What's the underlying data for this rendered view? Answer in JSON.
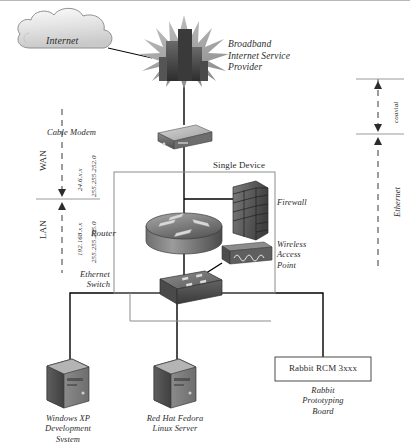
{
  "diagram": {
    "nodes": {
      "internet": {
        "label": "Internet",
        "shape": "cloud"
      },
      "isp": {
        "label": "Broadband\nInternet Service\nProvider",
        "shape": "buildings-burst"
      },
      "cable_modem": {
        "label": "Cable Modem",
        "shape": "modem-box"
      },
      "single_device": {
        "label": "Single Device",
        "shape": "enclosure"
      },
      "router": {
        "label": "Router",
        "shape": "router-cylinder"
      },
      "firewall": {
        "label": "Firewall",
        "shape": "brick-wall"
      },
      "wireless_ap": {
        "label": "Wireless\nAccess\nPoint",
        "shape": "wap-box"
      },
      "ethernet_switch": {
        "label": "Ethernet\nSwitch",
        "shape": "switch-box"
      },
      "windows_pc": {
        "label": "Windows XP\nDevelopment\nSystem",
        "shape": "tower-pc"
      },
      "linux_server": {
        "label": "Red Hat Fedora\nLinux Server",
        "shape": "tower-pc"
      },
      "rabbit_board": {
        "box_label": "Rabbit RCM  3xxx",
        "caption": "Rabbit\nPrototyping\nBoard",
        "shape": "rect-box"
      }
    },
    "left_scale": {
      "wan_label": "WAN",
      "lan_label": "LAN",
      "wan_ip": "24.6.x.x",
      "wan_mask": "255.255.252.0",
      "lan_ip": "192.168.x.x",
      "lan_mask": "255.255.255.0"
    },
    "right_scale": {
      "coaxial_label": "coaxial",
      "ethernet_label": "Ethernet"
    }
  },
  "colors": {
    "ink": "#2b2b2b",
    "line": "#000000",
    "rule": "#9a9a9a",
    "device_dark": "#4a4a4a",
    "device_mid": "#7a7a7a",
    "device_light": "#b5b5b5",
    "cloud_fill": "#e3e3e3",
    "enclosure_border": "#8c8c8c"
  }
}
